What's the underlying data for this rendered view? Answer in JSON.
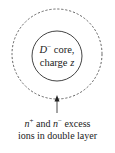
{
  "diagram": {
    "outer_circle": {
      "style": "dashed",
      "meaning": "double layer boundary"
    },
    "inner_circle": {
      "style": "solid",
      "meaning": "core"
    },
    "core_label": {
      "symbol": "D",
      "symbol_sup": "−",
      "line1_rest": " core,",
      "line2_prefix": "charge ",
      "line2_var": "z"
    },
    "arrow": {
      "direction": "up",
      "icon": "arrow-up-icon"
    },
    "caption": {
      "n": "n",
      "plus": "+",
      "and": " and ",
      "n2": "n",
      "minus": "−",
      "rest1": " excess",
      "line2": "ions in double layer"
    },
    "colors": {
      "stroke": "#444444",
      "text": "#222222",
      "background": "#ffffff"
    }
  }
}
